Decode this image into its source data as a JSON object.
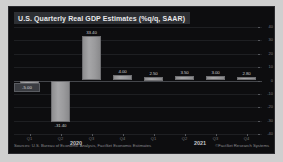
{
  "chart_data": {
    "type": "bar",
    "title": "U.S. Quarterly Real GDP Estimates (%q/q, SAAR)",
    "xlabel": "",
    "ylabel": "",
    "ylim": [
      -40,
      40
    ],
    "grid": true,
    "legend": "none",
    "categories": [
      "Q1",
      "Q2",
      "Q3",
      "Q4",
      "Q1",
      "Q2",
      "Q3",
      "Q4"
    ],
    "group_labels": [
      "2020",
      "2021"
    ],
    "values": [
      -5.0,
      -31.4,
      33.4,
      4.0,
      2.5,
      3.5,
      3.0,
      2.8
    ],
    "value_labels": [
      "-5.00",
      "-31.40",
      "33.40",
      "4.00",
      "2.50",
      "3.50",
      "3.00",
      "2.80"
    ],
    "yticks": [
      40,
      30,
      20,
      10,
      0,
      -10,
      -20,
      -30,
      -40
    ],
    "ytick_labels": [
      "40",
      "30",
      "20",
      "10",
      "0",
      "-10",
      "-20",
      "-30",
      "-40"
    ],
    "bar_color": "#9a9a9c",
    "background_color": "#0d0d0f",
    "title_background": "#2d2f33",
    "text_color": "#c9c9cb"
  },
  "footer": {
    "source": "Sources: U.S. Bureau of Economic Analysis, FactSet Economic Estimates",
    "attribution": "©FactSet Research Systems"
  }
}
